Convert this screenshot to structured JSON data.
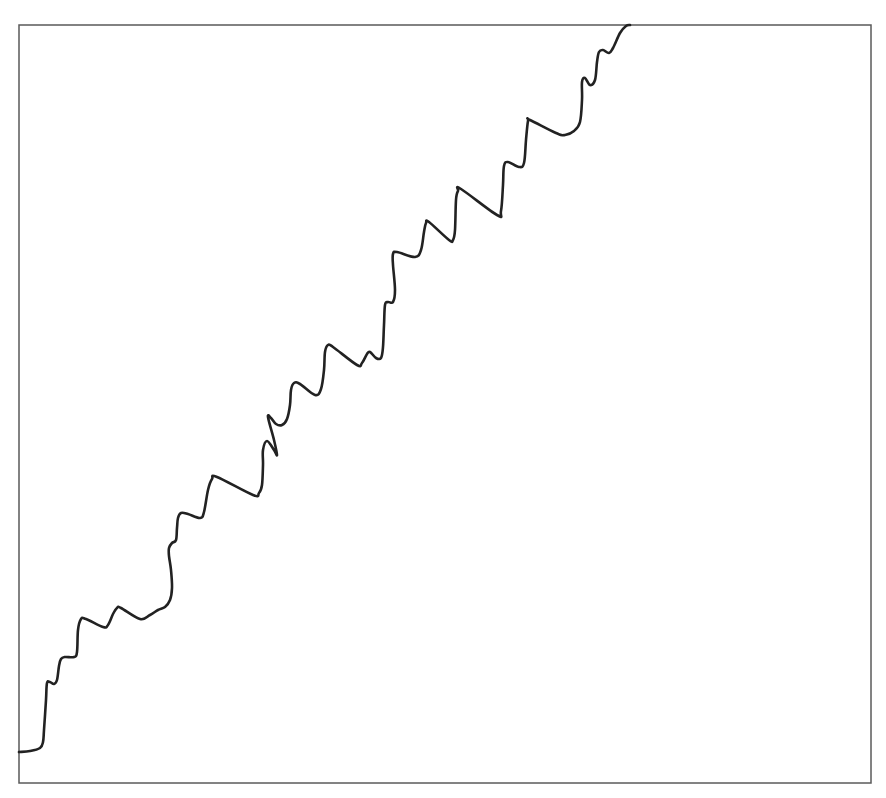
{
  "chart_data": {
    "type": "line",
    "title": "",
    "xlabel": "",
    "ylabel": "",
    "grid": false,
    "legend": null,
    "frame": {
      "left": 19,
      "top": 25,
      "right": 871,
      "bottom": 783
    },
    "colors": {
      "line": "#222222",
      "frame": "#5a5a5a",
      "background": "#ffffff"
    },
    "series": [
      {
        "name": "series-1",
        "points_px": [
          [
            19,
            752
          ],
          [
            30,
            751
          ],
          [
            40,
            748
          ],
          [
            43,
            742
          ],
          [
            44,
            730
          ],
          [
            46,
            700
          ],
          [
            47,
            683
          ],
          [
            50,
            682
          ],
          [
            54,
            684
          ],
          [
            57,
            680
          ],
          [
            59,
            666
          ],
          [
            61,
            659
          ],
          [
            65,
            657
          ],
          [
            74,
            657
          ],
          [
            77,
            652
          ],
          [
            78,
            630
          ],
          [
            81,
            619
          ],
          [
            86,
            619
          ],
          [
            103,
            627
          ],
          [
            108,
            625
          ],
          [
            113,
            614
          ],
          [
            117,
            608
          ],
          [
            121,
            608
          ],
          [
            140,
            619
          ],
          [
            150,
            615
          ],
          [
            158,
            610
          ],
          [
            165,
            607
          ],
          [
            170,
            600
          ],
          [
            172,
            588
          ],
          [
            171,
            570
          ],
          [
            169,
            556
          ],
          [
            169,
            548
          ],
          [
            172,
            543
          ],
          [
            176,
            540
          ],
          [
            177,
            528
          ],
          [
            178,
            518
          ],
          [
            181,
            513
          ],
          [
            188,
            514
          ],
          [
            200,
            518
          ],
          [
            204,
            512
          ],
          [
            208,
            490
          ],
          [
            212,
            479
          ],
          [
            217,
            477
          ],
          [
            253,
            495
          ],
          [
            259,
            493
          ],
          [
            262,
            485
          ],
          [
            263,
            465
          ],
          [
            263,
            450
          ],
          [
            267,
            441
          ],
          [
            274,
            450
          ],
          [
            277,
            455
          ],
          [
            274,
            440
          ],
          [
            268,
            417
          ],
          [
            271,
            418
          ],
          [
            276,
            424
          ],
          [
            282,
            425
          ],
          [
            287,
            419
          ],
          [
            290,
            405
          ],
          [
            291,
            390
          ],
          [
            294,
            383
          ],
          [
            300,
            384
          ],
          [
            315,
            395
          ],
          [
            321,
            389
          ],
          [
            324,
            370
          ],
          [
            325,
            352
          ],
          [
            328,
            345
          ],
          [
            333,
            347
          ],
          [
            357,
            365
          ],
          [
            362,
            363
          ],
          [
            367,
            354
          ],
          [
            370,
            352
          ],
          [
            376,
            358
          ],
          [
            381,
            358
          ],
          [
            383,
            347
          ],
          [
            384,
            325
          ],
          [
            385,
            305
          ],
          [
            388,
            302
          ],
          [
            393,
            302
          ],
          [
            395,
            290
          ],
          [
            393,
            265
          ],
          [
            393,
            254
          ],
          [
            397,
            252
          ],
          [
            415,
            257
          ],
          [
            421,
            250
          ],
          [
            424,
            232
          ],
          [
            426,
            223
          ],
          [
            429,
            222
          ],
          [
            449,
            240
          ],
          [
            453,
            240
          ],
          [
            455,
            230
          ],
          [
            456,
            200
          ],
          [
            458,
            191
          ],
          [
            461,
            189
          ],
          [
            497,
            215
          ],
          [
            501,
            211
          ],
          [
            503,
            185
          ],
          [
            504,
            166
          ],
          [
            508,
            162
          ],
          [
            519,
            167
          ],
          [
            524,
            163
          ],
          [
            526,
            140
          ],
          [
            528,
            121
          ],
          [
            530,
            120
          ],
          [
            556,
            133
          ],
          [
            565,
            135
          ],
          [
            574,
            131
          ],
          [
            580,
            122
          ],
          [
            582,
            100
          ],
          [
            582,
            82
          ],
          [
            585,
            78
          ],
          [
            590,
            85
          ],
          [
            595,
            80
          ],
          [
            597,
            62
          ],
          [
            599,
            52
          ],
          [
            603,
            50
          ],
          [
            609,
            53
          ],
          [
            613,
            48
          ],
          [
            620,
            33
          ],
          [
            626,
            26
          ],
          [
            630,
            25
          ]
        ]
      }
    ],
    "trend": "stepwise increasing with oscillations from bottom-left to top-right"
  }
}
